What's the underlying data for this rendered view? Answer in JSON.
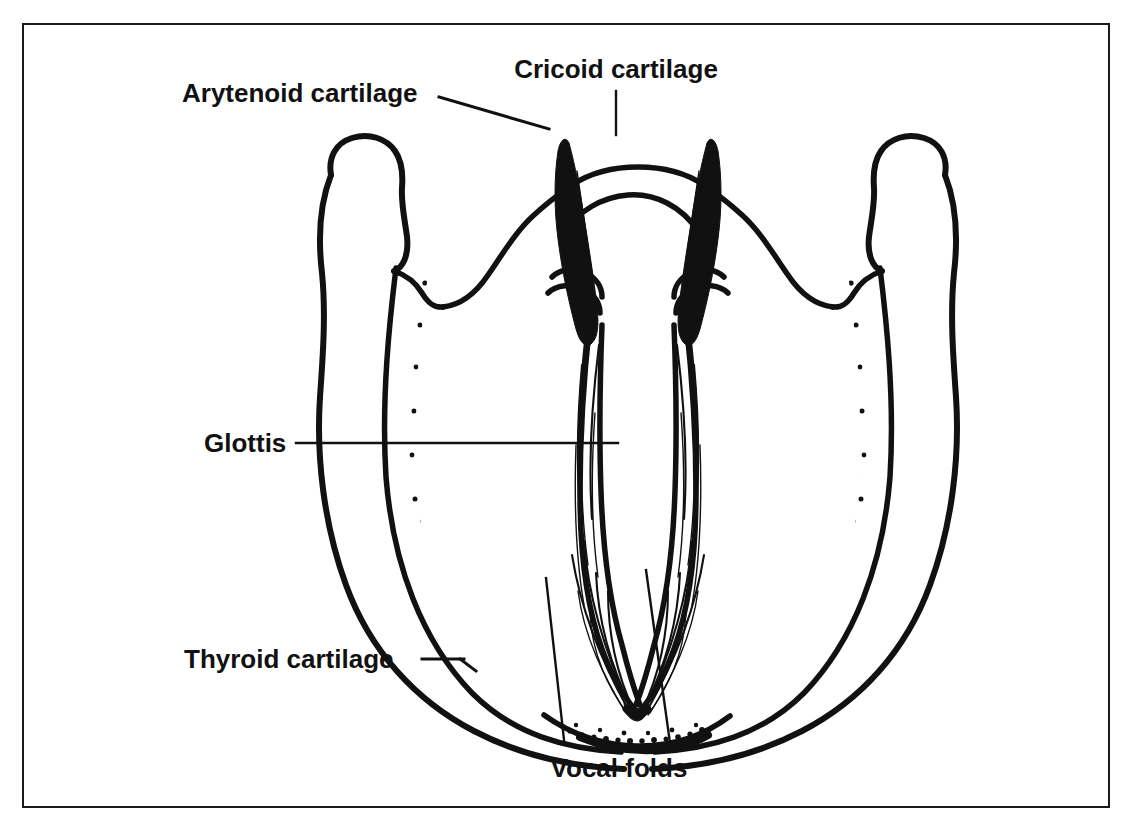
{
  "figure": {
    "border_color": "#1a1a1a",
    "ink_color": "#111111",
    "background_color": "#ffffff"
  },
  "labels": {
    "arytenoid": {
      "text": "Arytenoid cartilage",
      "x": 180,
      "y": 100,
      "anchor": "start",
      "icon": "leader-line-icon"
    },
    "cricoid": {
      "text": "Cricoid cartilage",
      "x": 614,
      "y": 76,
      "anchor": "middle",
      "icon": "leader-line-icon"
    },
    "glottis": {
      "text": "Glottis",
      "x": 202,
      "y": 447,
      "anchor": "start",
      "icon": "leader-line-icon"
    },
    "thyroid": {
      "text": "Thyroid cartilage",
      "x": 182,
      "y": 661,
      "anchor": "start",
      "icon": "leader-line-icon"
    },
    "vocal_folds": {
      "text": "Vocal folds",
      "x": 617,
      "y": 775,
      "anchor": "middle",
      "icon": "leader-line-icon"
    }
  },
  "structures": [
    {
      "name": "arytenoid-cartilage-left",
      "label": "Arytenoid cartilage",
      "side": "left"
    },
    {
      "name": "arytenoid-cartilage-right",
      "label": "Arytenoid cartilage",
      "side": "right"
    },
    {
      "name": "cricoid-cartilage",
      "label": "Cricoid cartilage",
      "side": "center"
    },
    {
      "name": "thyroid-cartilage-left",
      "label": "Thyroid cartilage",
      "side": "left"
    },
    {
      "name": "thyroid-cartilage-right",
      "label": "Thyroid cartilage",
      "side": "right"
    },
    {
      "name": "superior-horn-left",
      "label": "Superior horn",
      "side": "left"
    },
    {
      "name": "superior-horn-right",
      "label": "Superior horn",
      "side": "right"
    },
    {
      "name": "vocal-fold-left",
      "label": "Vocal fold",
      "side": "left"
    },
    {
      "name": "vocal-fold-right",
      "label": "Vocal fold",
      "side": "right"
    },
    {
      "name": "glottis-opening",
      "label": "Glottis",
      "side": "center"
    }
  ]
}
